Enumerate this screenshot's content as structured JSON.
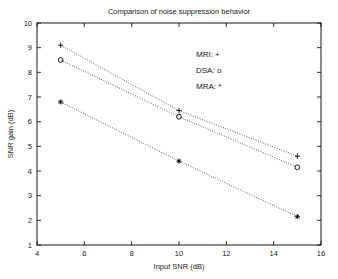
{
  "chart_data": {
    "type": "line",
    "title": "Comparison of noise suppression behavior",
    "xlabel": "Input SNR (dB)",
    "ylabel": "SNR gain (dB)",
    "x": [
      5,
      10,
      15
    ],
    "xlim": [
      4,
      16
    ],
    "ylim": [
      1,
      10
    ],
    "xticks": [
      4,
      6,
      8,
      10,
      12,
      14,
      16
    ],
    "yticks": [
      1,
      2,
      3,
      4,
      5,
      6,
      7,
      8,
      9,
      10
    ],
    "grid": false,
    "legend_position": "upper-right-inside",
    "series": [
      {
        "name": "MRI",
        "marker": "+",
        "linestyle": "dotted",
        "values": [
          9.1,
          6.45,
          4.6
        ]
      },
      {
        "name": "DSA",
        "marker": "o",
        "linestyle": "dotted",
        "values": [
          8.5,
          6.2,
          4.15
        ]
      },
      {
        "name": "MRA",
        "marker": "*",
        "linestyle": "dotted",
        "values": [
          6.8,
          4.4,
          2.15
        ]
      }
    ],
    "legend_entries": [
      {
        "label": "MRI: +"
      },
      {
        "label": "DSA: o"
      },
      {
        "label": "MRA: *"
      }
    ],
    "colors": {
      "line": "#000000",
      "axis": "#000000",
      "background": "#ffffff"
    }
  },
  "axis": {
    "xtick_labels": [
      "4",
      "6",
      "8",
      "10",
      "12",
      "14",
      "16"
    ],
    "ytick_labels": [
      "1",
      "2",
      "3",
      "4",
      "5",
      "6",
      "7",
      "8",
      "9",
      "10"
    ]
  }
}
